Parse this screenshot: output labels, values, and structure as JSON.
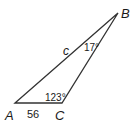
{
  "diagram": {
    "type": "triangle",
    "vertices": {
      "A": {
        "label": "A"
      },
      "B": {
        "label": "B"
      },
      "C": {
        "label": "C"
      }
    },
    "sides": {
      "AB": {
        "label": "c"
      },
      "AC": {
        "label": "56"
      }
    },
    "angles": {
      "B": {
        "label": "17°"
      },
      "C": {
        "label": "123°"
      }
    },
    "colors": {
      "stroke": "#333333",
      "text": "#1a1a1a"
    }
  }
}
